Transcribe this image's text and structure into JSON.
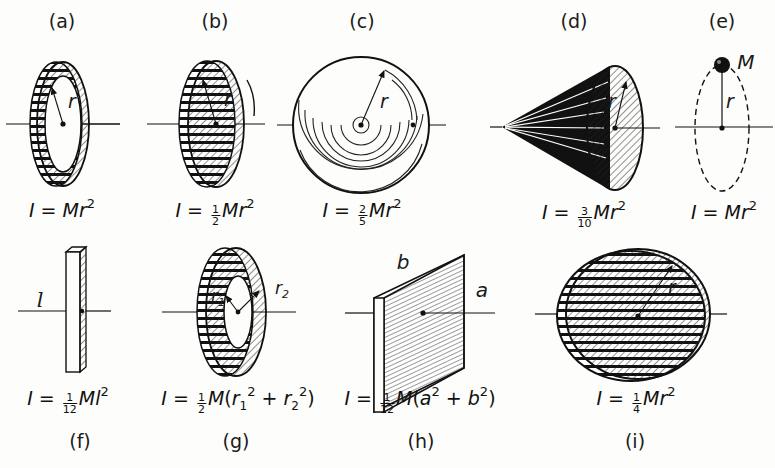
{
  "panels": [
    {
      "id": "a",
      "label": "(a)",
      "shape": "thin ring / hoop about central axis",
      "symbols": [
        "r"
      ],
      "formula": {
        "lhs": "I",
        "coef": "",
        "body": "Mr",
        "exp": "2"
      }
    },
    {
      "id": "b",
      "label": "(b)",
      "shape": "solid disk / cylinder about central axis",
      "symbols": [
        "r"
      ],
      "formula": {
        "lhs": "I",
        "coef_num": "1",
        "coef_den": "2",
        "body": "Mr",
        "exp": "2"
      }
    },
    {
      "id": "c",
      "label": "(c)",
      "shape": "solid sphere about diameter",
      "symbols": [
        "r"
      ],
      "formula": {
        "lhs": "I",
        "coef_num": "2",
        "coef_den": "5",
        "body": "Mr",
        "exp": "2"
      }
    },
    {
      "id": "d",
      "label": "(d)",
      "shape": "solid cone about its axis",
      "symbols": [
        "r"
      ],
      "formula": {
        "lhs": "I",
        "coef_num": "3",
        "coef_den": "10",
        "body": "Mr",
        "exp": "2"
      }
    },
    {
      "id": "e",
      "label": "(e)",
      "shape": "point mass at radius r",
      "symbols": [
        "M",
        "r"
      ],
      "formula": {
        "lhs": "I",
        "coef": "",
        "body": "Mr",
        "exp": "2"
      }
    },
    {
      "id": "f",
      "label": "(f)",
      "shape": "thin rod about center",
      "symbols": [
        "l"
      ],
      "formula": {
        "lhs": "I",
        "coef_num": "1",
        "coef_den": "12",
        "body": "Ml",
        "exp": "2"
      }
    },
    {
      "id": "g",
      "label": "(g)",
      "shape": "annular cylinder about central axis",
      "symbols": [
        "r1",
        "r2"
      ],
      "formula": {
        "lhs": "I",
        "coef_num": "1",
        "coef_den": "2",
        "body": "M",
        "paren": "(r1² + r2²)"
      }
    },
    {
      "id": "h",
      "label": "(h)",
      "shape": "rectangular plate about perpendicular central axis",
      "symbols": [
        "a",
        "b"
      ],
      "formula": {
        "lhs": "I",
        "coef_num": "1",
        "coef_den": "12",
        "body": "M",
        "paren": "(a² + b²)"
      }
    },
    {
      "id": "i",
      "label": "(i)",
      "shape": "solid disk about diameter",
      "symbols": [
        "r"
      ],
      "formula": {
        "lhs": "I",
        "coef_num": "1",
        "coef_den": "4",
        "body": "Mr",
        "exp": "2"
      }
    }
  ],
  "text": {
    "r": "r",
    "M": "M",
    "l": "l",
    "a": "a",
    "b": "b",
    "r1": "r",
    "r1sub": "1",
    "r2": "r",
    "r2sub": "2",
    "I": "I",
    "eq": " = ",
    "Mr": "Mr",
    "M_only": "M",
    "Ml": "Ml",
    "two": "2",
    "plus": " + ",
    "lparen": "(",
    "rparen": ")",
    "a_sym": "a",
    "b_sym": "b"
  },
  "colors": {
    "ink": "#111111",
    "paper": "#fdfdfb"
  }
}
